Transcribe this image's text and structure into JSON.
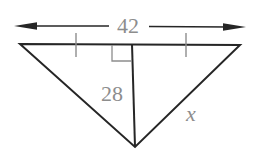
{
  "diagram": {
    "type": "geometry-triangle",
    "labels": {
      "top_dimension": "42",
      "altitude": "28",
      "unknown_side": "x"
    },
    "colors": {
      "line": "#262626",
      "muted": "#8d8d8d",
      "background": "#ffffff"
    }
  }
}
